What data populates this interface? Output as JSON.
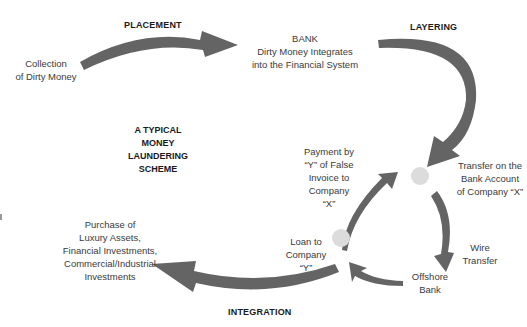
{
  "title": "A TYPICAL\nMONEY\nLAUNDERING\nSCHEME",
  "stages": {
    "placement": "PLACEMENT",
    "layering": "LAYERING",
    "integration": "INTEGRATION"
  },
  "labels": {
    "collection": "Collection\nof Dirty Money",
    "bank": "BANK\nDirty Money Integrates\ninto the Financial System",
    "transfer_x": "Transfer on the\nBank Account\nof Company “X”",
    "wire_transfer": "Wire\nTransfer",
    "offshore_bank": "Offshore\nBank",
    "loan_y": "Loan to\nCompany\n“Y”",
    "payment_y": "Payment by\n“Y” of False\nInvoice to\nCompany\n“X”",
    "purchase": "Purchase of\nLuxury Assets,\nFinancial Investments,\nCommercial/Industrial\nInvestments"
  },
  "colors": {
    "arrow": "#646464",
    "node": "#dcdcdc",
    "text": "#3a3a3a"
  }
}
